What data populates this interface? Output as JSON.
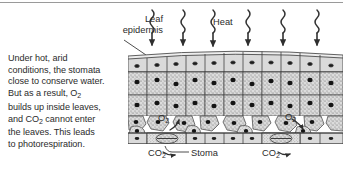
{
  "figure": {
    "caption_text": "Under hot, arid conditions, the stomata close to conserve water. But as a result, O2 builds up inside leaves, and CO2 cannot enter the leaves. This leads to photorespiration.",
    "caption_lines": [
      "Under hot, arid",
      "conditions, the stomata",
      "close to conserve water.",
      "But as a result, O",
      "builds up inside leaves,",
      "and CO",
      " cannot enter",
      "the leaves. This leads",
      "to photorespiration."
    ],
    "labels": {
      "leaf_epidermis": "Leaf\nepidermis",
      "leaf_epidermis_line1": "Leaf",
      "leaf_epidermis_line2": "epidermis",
      "heat": "Heat",
      "stoma": "Stoma",
      "oxygen": "O",
      "oxygen_subscript": "2",
      "carbon_dioxide": "CO",
      "carbon_dioxide_subscript": "2"
    },
    "heat_arrow_count": 6,
    "stomata_count": 2,
    "o2_label_count": 2,
    "co2_label_count": 2,
    "colors": {
      "ink": "#2b2b2b",
      "line": "#3a3a3a",
      "cell_fill": "#d8d8d8",
      "cell_fill_light": "#e4e4e4",
      "air_space": "#ffffff",
      "nucleus": "#1a1a1a",
      "rule": "#9a9a9a",
      "background": "#ffffff"
    }
  }
}
